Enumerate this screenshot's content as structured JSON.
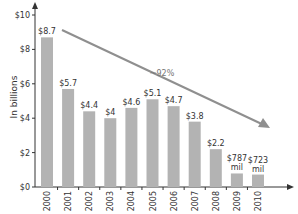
{
  "chart_data": {
    "type": "bar",
    "title": "",
    "xlabel": "",
    "ylabel": "In billions",
    "ylim": [
      0,
      10
    ],
    "yticks": [
      "$0",
      "$2",
      "$4",
      "$6",
      "$8",
      "$10"
    ],
    "ytick_values": [
      0,
      2,
      4,
      6,
      8,
      10
    ],
    "categories": [
      "2000",
      "2001",
      "2002",
      "2003",
      "2004",
      "2005",
      "2006",
      "2007",
      "2008",
      "2009",
      "2010"
    ],
    "values": [
      8.7,
      5.7,
      4.4,
      4.0,
      4.6,
      5.1,
      4.7,
      3.8,
      2.2,
      0.787,
      0.723
    ],
    "data_labels": [
      [
        "$8.7"
      ],
      [
        "$5.7"
      ],
      [
        "$4.4"
      ],
      [
        "$4"
      ],
      [
        "$4.6"
      ],
      [
        "$5.1"
      ],
      [
        "$4.7"
      ],
      [
        "$3.8"
      ],
      [
        "$2.2"
      ],
      [
        "$787",
        "mil"
      ],
      [
        "$723",
        "mil"
      ]
    ],
    "annotations": [
      {
        "type": "arrow",
        "text": "~92%",
        "description": "downward trend arrow from 2000 to 2010"
      }
    ],
    "grid": false,
    "legend": null,
    "bar_color": "#b3b3b3",
    "arrow_color": "#8f8f8f",
    "axis_color": "#333333"
  }
}
